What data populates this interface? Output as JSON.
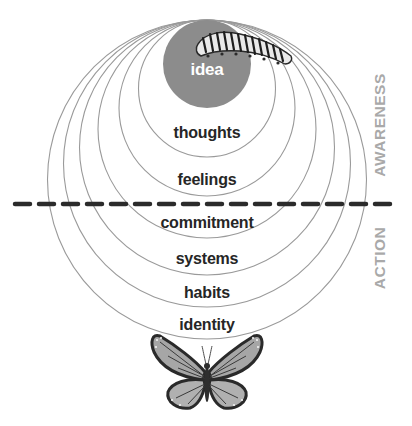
{
  "diagram": {
    "center_x": 207,
    "top_tangent_y": 20,
    "stroke_color": "#9a9a9a",
    "idea_fill": "#8c8c8c",
    "divider_color": "#2b2b2b",
    "rings": [
      {
        "label": "idea",
        "radius": 44,
        "filled": true,
        "label_y": 61
      },
      {
        "label": "thoughts",
        "radius": 68.5,
        "filled": false,
        "label_y": 124
      },
      {
        "label": "feelings",
        "radius": 88,
        "filled": false,
        "label_y": 171
      },
      {
        "label": "commitment",
        "radius": 109,
        "filled": false,
        "label_y": 214
      },
      {
        "label": "systems",
        "radius": 127.5,
        "filled": false,
        "label_y": 250
      },
      {
        "label": "habits",
        "radius": 143.5,
        "filled": false,
        "label_y": 284
      },
      {
        "label": "identity",
        "radius": 159.5,
        "filled": false,
        "label_y": 316
      }
    ],
    "divider": {
      "x1": 15,
      "x2": 398,
      "y": 204,
      "style": "dashed"
    },
    "side_labels": {
      "awareness": "AWARENESS",
      "action": "ACTION"
    },
    "icons": {
      "top": "caterpillar-icon",
      "bottom": "butterfly-icon"
    }
  }
}
